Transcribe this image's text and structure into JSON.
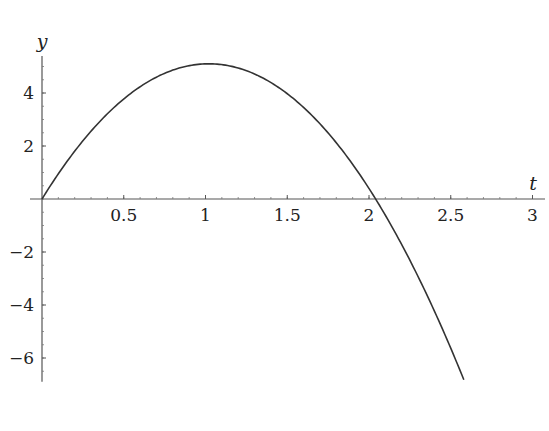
{
  "chart_data": {
    "type": "line",
    "title": "",
    "xlabel": "t",
    "ylabel": "y",
    "xlim": [
      0,
      3.05
    ],
    "ylim": [
      -6.9,
      5.4
    ],
    "grid": false,
    "legend": null,
    "x_ticks": [
      0.5,
      1,
      1.5,
      2,
      2.5,
      3
    ],
    "x_tick_labels": [
      "0.5",
      "1",
      "1.5",
      "2",
      "2.5",
      "3"
    ],
    "y_ticks": [
      -6,
      -4,
      -2,
      2,
      4
    ],
    "y_tick_labels": [
      "−6",
      "−4",
      "−2",
      "2",
      "4"
    ],
    "series": [
      {
        "name": "y(t)",
        "color": "#333333",
        "x": [
          0,
          0.25,
          0.5,
          0.75,
          1.0,
          1.25,
          1.5,
          1.75,
          2.0,
          2.04,
          2.25,
          2.5,
          2.58
        ],
        "y": [
          0,
          2.19,
          3.78,
          4.74,
          5.1,
          4.84,
          3.98,
          2.49,
          0.4,
          0.0,
          -2.31,
          -5.63,
          -6.82
        ]
      }
    ],
    "annotations": []
  }
}
